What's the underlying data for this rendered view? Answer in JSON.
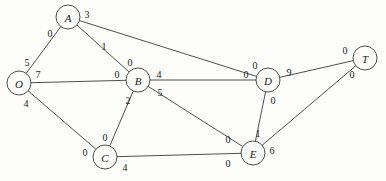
{
  "diagram": {
    "background_color": "#fdfdfb",
    "stroke_color": "#3a3a3a",
    "text_color": "#1a1a1a",
    "width": 386,
    "height": 181
  },
  "chart_data": {
    "type": "diagram",
    "graph_kind": "undirected-network",
    "nodes": [
      {
        "id": "O",
        "label": "O",
        "x": 19,
        "y": 83,
        "r": 12
      },
      {
        "id": "A",
        "label": "A",
        "x": 68,
        "y": 17,
        "r": 12
      },
      {
        "id": "B",
        "label": "B",
        "x": 138,
        "y": 80,
        "r": 12
      },
      {
        "id": "C",
        "label": "C",
        "x": 105,
        "y": 157,
        "r": 12
      },
      {
        "id": "D",
        "label": "D",
        "x": 268,
        "y": 80,
        "r": 12
      },
      {
        "id": "E",
        "label": "E",
        "x": 253,
        "y": 153,
        "r": 12
      },
      {
        "id": "T",
        "label": "T",
        "x": 365,
        "y": 58,
        "r": 12
      }
    ],
    "edges": [
      {
        "from": "O",
        "to": "A",
        "label_from": "5",
        "label_to": "0",
        "lx_from": 27,
        "ly_from": 62,
        "lx_to": 50,
        "ly_to": 33
      },
      {
        "from": "O",
        "to": "B",
        "label_from": "7",
        "label_to": "0",
        "lx_from": 38,
        "ly_from": 74,
        "lx_to": 117,
        "ly_to": 74
      },
      {
        "from": "O",
        "to": "C",
        "label_from": "4",
        "label_to": "0",
        "lx_from": 26,
        "ly_from": 103,
        "lx_to": 85,
        "ly_to": 152
      },
      {
        "from": "A",
        "to": "B",
        "label_from": "1",
        "label_to": "0",
        "lx_from": 104,
        "ly_from": 46,
        "lx_to": 130,
        "ly_to": 62
      },
      {
        "from": "A",
        "to": "D",
        "label_from": "3",
        "label_to": "0",
        "lx_from": 87,
        "ly_from": 14,
        "lx_to": 255,
        "ly_to": 65
      },
      {
        "from": "B",
        "to": "C",
        "label_from": "2",
        "label_to": "0",
        "lx_from": 128,
        "ly_from": 100,
        "lx_to": 105,
        "ly_to": 137
      },
      {
        "from": "B",
        "to": "D",
        "label_from": "4",
        "label_to": "0",
        "lx_from": 159,
        "ly_from": 74,
        "lx_to": 246,
        "ly_to": 74
      },
      {
        "from": "B",
        "to": "E",
        "label_from": "5",
        "label_to": "0",
        "lx_from": 160,
        "ly_from": 92,
        "lx_to": 228,
        "ly_to": 139
      },
      {
        "from": "C",
        "to": "E",
        "label_from": "4",
        "label_to": "0",
        "lx_from": 125,
        "ly_from": 167,
        "lx_to": 228,
        "ly_to": 163
      },
      {
        "from": "D",
        "to": "E",
        "label_from": "0",
        "label_to": "1",
        "lx_from": 273,
        "ly_from": 100,
        "lx_to": 258,
        "ly_to": 133
      },
      {
        "from": "D",
        "to": "T",
        "label_from": "9",
        "label_to": "0",
        "lx_from": 289,
        "ly_from": 72,
        "lx_to": 345,
        "ly_to": 50
      },
      {
        "from": "E",
        "to": "T",
        "label_from": "6",
        "label_to": "0",
        "lx_from": 272,
        "ly_from": 150,
        "lx_to": 352,
        "ly_to": 74
      }
    ],
    "node_count": 7,
    "edge_count": 12,
    "title": "",
    "xlabel": "",
    "ylabel": ""
  }
}
